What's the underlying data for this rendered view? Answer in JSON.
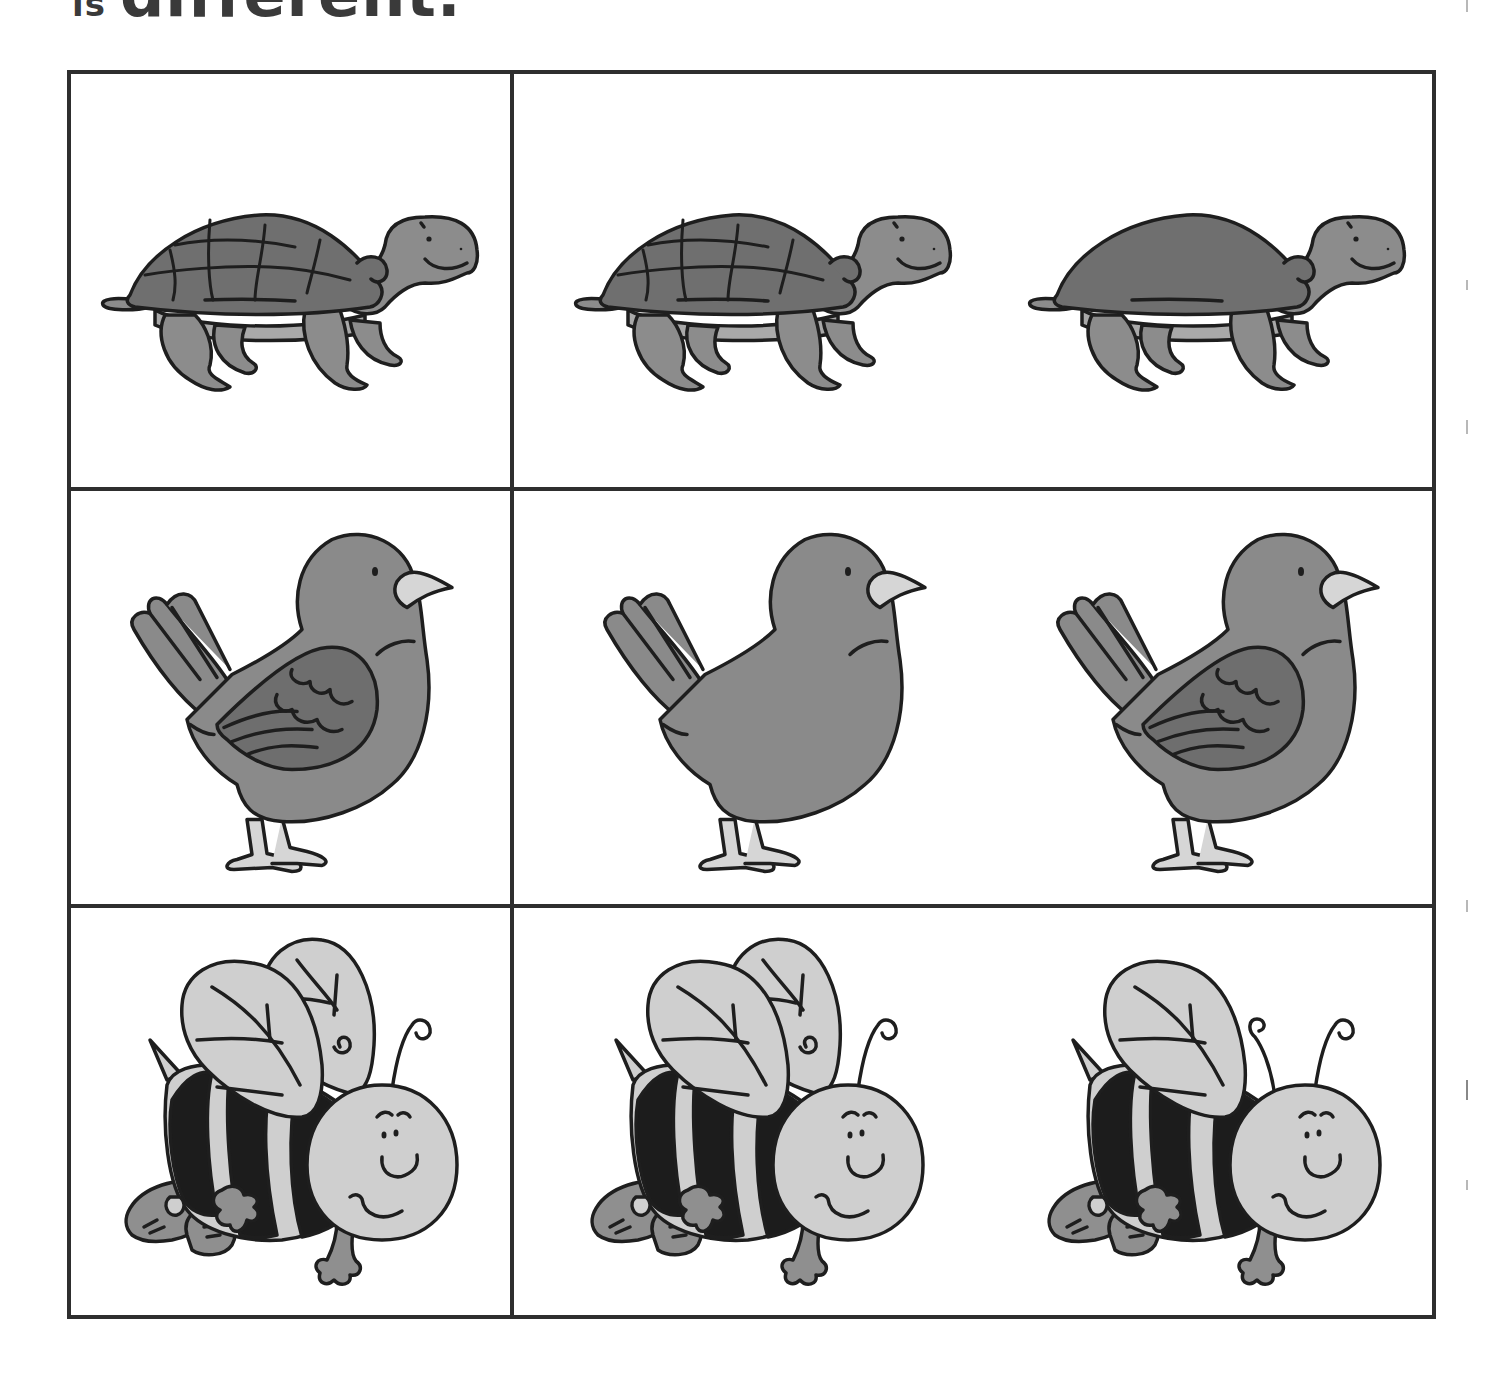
{
  "heading": {
    "prefix": "is",
    "text": "different."
  },
  "colors": {
    "border": "#2e2e2e",
    "outline": "#1e1e1e",
    "shell": "#6f6f6f",
    "skin": "#8c8c8c",
    "belly": "#a9a9a9",
    "bird_body": "#8a8a8a",
    "bird_wing": "#6e6e6e",
    "beak": "#d6d6d6",
    "bee_light": "#cfcfcf",
    "bee_stripe": "#1c1c1c",
    "bee_shoe": "#8f8f8f"
  },
  "rows": [
    {
      "animal": "turtle",
      "reference": {
        "label": "turtle reference",
        "variant": "patterned-shell"
      },
      "options": [
        {
          "label": "turtle option 1",
          "variant": "patterned-shell"
        },
        {
          "label": "turtle option 2",
          "variant": "plain-shell"
        }
      ]
    },
    {
      "animal": "bird",
      "reference": {
        "label": "bird reference",
        "variant": "with-wing"
      },
      "options": [
        {
          "label": "bird option 1",
          "variant": "no-wing"
        },
        {
          "label": "bird option 2",
          "variant": "with-wing"
        }
      ]
    },
    {
      "animal": "bee",
      "reference": {
        "label": "bee reference",
        "variant": "two-wings-one-antenna"
      },
      "options": [
        {
          "label": "bee option 1",
          "variant": "two-wings-one-antenna"
        },
        {
          "label": "bee option 2",
          "variant": "one-wing-two-antennae"
        }
      ]
    }
  ]
}
